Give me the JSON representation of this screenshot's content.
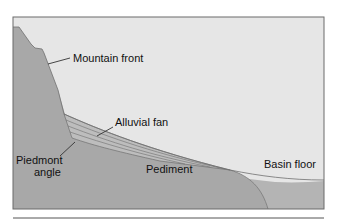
{
  "diagram": {
    "labels": {
      "mountain_front": "Mountain front",
      "alluvial_fan": "Alluvial fan",
      "piedmont_line1": "Piedmont",
      "piedmont_line2": "angle",
      "pediment": "Pediment",
      "basin_floor": "Basin floor"
    },
    "colors": {
      "sky": "#e6e6e6",
      "rock": "#a9a9a9",
      "fan": "#b8b8b8",
      "basin_fill": "#b2b2b2",
      "frame": "#6b6b6b",
      "leader": "#333333",
      "separator": "#555555"
    }
  }
}
